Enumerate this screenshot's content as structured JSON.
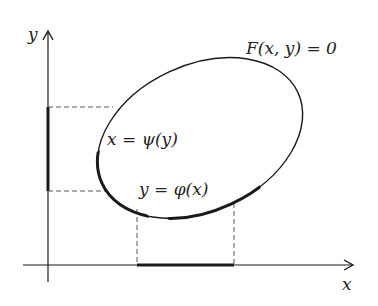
{
  "diagram": {
    "axes": {
      "x_label": "x",
      "y_label": "y"
    },
    "curve_label": "F(x, y) = 0",
    "labels": {
      "psi": "x = ψ(y)",
      "phi": "y = φ(x)"
    },
    "colors": {
      "stroke": "#1a1a1a",
      "dashed": "#555555",
      "background": "#ffffff"
    }
  }
}
